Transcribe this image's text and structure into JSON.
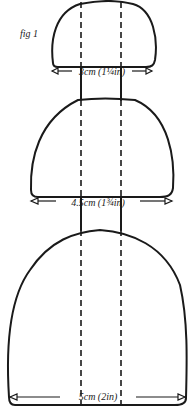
{
  "figure": {
    "label": "fig 1",
    "shapes": [
      {
        "name": "small",
        "measurement": "3cm (1¼in)"
      },
      {
        "name": "medium",
        "measurement": "4.5cm (1¾in)"
      },
      {
        "name": "large",
        "measurement": "5cm (2in)"
      }
    ],
    "colors": {
      "ink": "#1a1a1a",
      "background": "#ffffff"
    }
  }
}
